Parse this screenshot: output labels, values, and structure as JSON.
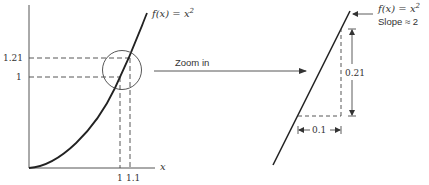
{
  "left_plot": {
    "function_label": "f(x) = x",
    "function_exp": "2",
    "x_axis_label": "x",
    "y_ticks": [
      {
        "label": "1.21",
        "y": 58
      },
      {
        "label": "1",
        "y": 77
      }
    ],
    "x_ticks": [
      {
        "label": "1",
        "x": 120
      },
      {
        "label": "1.1",
        "x": 130
      }
    ]
  },
  "zoom_arrow": {
    "label": "Zoom in"
  },
  "right_plot": {
    "function_label": "f(x) = x",
    "function_exp": "2",
    "slope_label": "Slope ≈ 2",
    "rise_label": "0.21",
    "run_label": "0.1"
  },
  "colors": {
    "ink": "#222222",
    "dashed": "#444444",
    "text": "#333333"
  }
}
